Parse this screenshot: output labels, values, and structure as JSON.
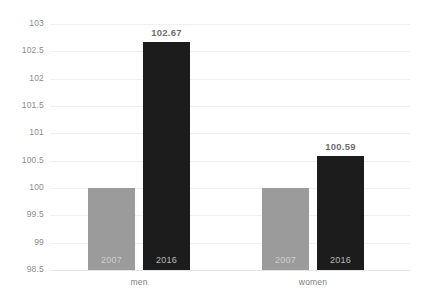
{
  "chart_data": {
    "type": "bar",
    "title": "",
    "subtitle": "",
    "xlabel": "",
    "ylabel": "",
    "categories": [
      "men",
      "women"
    ],
    "series": [
      {
        "name": "2007",
        "values": [
          100,
          100
        ],
        "color": "#9b9b9b"
      },
      {
        "name": "2016",
        "values": [
          102.67,
          100.59
        ],
        "color": "#1c1c1c"
      }
    ],
    "value_labels": [
      {
        "group": "men",
        "series": "2016",
        "text": "102.67"
      },
      {
        "group": "women",
        "series": "2016",
        "text": "100.59"
      }
    ],
    "ylim": [
      98.5,
      103
    ],
    "ytick_step": 0.5,
    "ytick_labels": [
      "103",
      "102.5",
      "102",
      "101.5",
      "101",
      "100.5",
      "100",
      "99.5",
      "99",
      "98.5"
    ],
    "grid": true,
    "grid_axis": "y",
    "legend": "none",
    "bar_year_labels": [
      "2007",
      "2016",
      "2007",
      "2016"
    ]
  },
  "axis": {
    "ticks": [
      {
        "label": "103",
        "value": 103
      },
      {
        "label": "102.5",
        "value": 102.5
      },
      {
        "label": "102",
        "value": 102
      },
      {
        "label": "101.5",
        "value": 101.5
      },
      {
        "label": "101",
        "value": 101
      },
      {
        "label": "100.5",
        "value": 100.5
      },
      {
        "label": "100",
        "value": 100
      },
      {
        "label": "99.5",
        "value": 99.5
      },
      {
        "label": "99",
        "value": 99
      },
      {
        "label": "98.5",
        "value": 98.5
      }
    ]
  },
  "bars": [
    {
      "group": "men",
      "series": "2007",
      "value": 100,
      "year_label": "2007",
      "value_label": ""
    },
    {
      "group": "men",
      "series": "2016",
      "value": 102.67,
      "year_label": "2016",
      "value_label": "102.67"
    },
    {
      "group": "women",
      "series": "2007",
      "value": 100,
      "year_label": "2007",
      "value_label": ""
    },
    {
      "group": "women",
      "series": "2016",
      "value": 100.59,
      "year_label": "2016",
      "value_label": "100.59"
    }
  ],
  "groups": [
    {
      "label": "men"
    },
    {
      "label": "women"
    }
  ],
  "colors": {
    "series_2007": "#9b9b9b",
    "series_2016": "#1c1c1c",
    "gridline": "#f0f0f0",
    "tick_text": "#8c8c8c",
    "value_text": "#6f6f6f",
    "background": "#ffffff"
  }
}
